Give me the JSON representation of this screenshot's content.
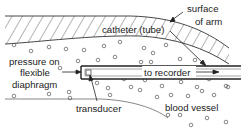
{
  "diagram": {
    "labels": {
      "surface": "surface",
      "of_arm": "of arm",
      "catheter": "catheter (tube)",
      "pressure_on": "pressure on",
      "flexible": "flexible",
      "diaphragm": "diaphragm",
      "to_recorder": "to recorder",
      "transducer": "transducer",
      "blood_vessel": "blood vessel"
    },
    "regions": [
      "arm tissue (hatched)",
      "blood vessel (with blood cells)",
      "catheter tube",
      "transducer"
    ],
    "colors": {
      "line": "#333333",
      "background": "#ffffff"
    }
  }
}
